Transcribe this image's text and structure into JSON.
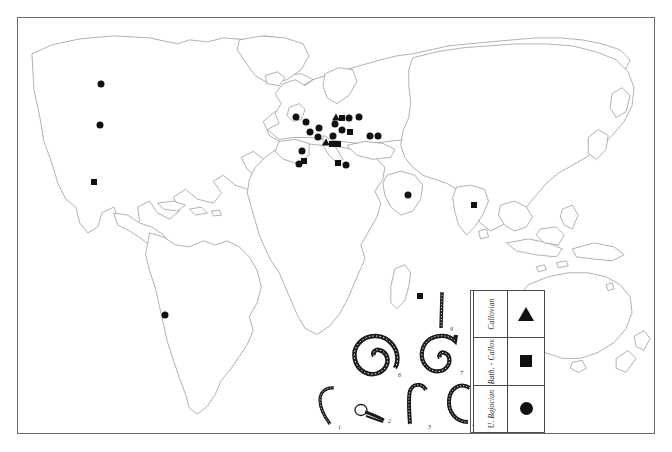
{
  "figure": {
    "type": "distribution-map",
    "frame_border_color": "#6b6b6b",
    "coastline_color": "#8e8e8e",
    "marker_color": "#111111",
    "background": "#ffffff"
  },
  "legend": {
    "title": "",
    "rows": [
      {
        "label": "Callovian",
        "symbol": "triangle",
        "symbol_name": "triangle-marker"
      },
      {
        "label": "Bath. - Callov.",
        "symbol": "square",
        "symbol_name": "square-marker"
      },
      {
        "label": "U. Bajocian",
        "symbol": "circle",
        "symbol_name": "circle-marker"
      }
    ]
  },
  "fossil_plate": {
    "caption": "",
    "specimens": [
      {
        "num": "1",
        "shape": "hook"
      },
      {
        "num": "2",
        "shape": "small-hook"
      },
      {
        "num": "3",
        "shape": "hook"
      },
      {
        "num": "4",
        "shape": "open-hook"
      },
      {
        "num": "5",
        "shape": "coiled-spiral"
      },
      {
        "num": "6",
        "shape": "coiled-spiral"
      },
      {
        "num": "7",
        "shape": "coiled-spiral"
      },
      {
        "num": "8",
        "shape": "straight-rod"
      },
      {
        "num": "9",
        "shape": "straight-rod"
      },
      {
        "num": "10",
        "shape": "curved-rod"
      }
    ]
  },
  "markers": [
    {
      "id": "na-1",
      "type": "circle",
      "x": 83,
      "y": 66,
      "region": "North America - Northwest Canada"
    },
    {
      "id": "na-2",
      "type": "circle",
      "x": 82,
      "y": 107,
      "region": "North America - Western USA"
    },
    {
      "id": "na-3",
      "type": "square",
      "x": 76,
      "y": 164,
      "region": "North America - Mexico"
    },
    {
      "id": "sa-1",
      "type": "circle",
      "x": 147,
      "y": 297,
      "region": "South America - Andes"
    },
    {
      "id": "eu-1",
      "type": "circle",
      "x": 278,
      "y": 99,
      "region": "Europe - British Isles"
    },
    {
      "id": "eu-2",
      "type": "circle",
      "x": 288,
      "y": 104,
      "region": "Europe - Northern France"
    },
    {
      "id": "eu-3",
      "type": "circle",
      "x": 292,
      "y": 114,
      "region": "Europe - France"
    },
    {
      "id": "eu-4",
      "type": "circle",
      "x": 301,
      "y": 110,
      "region": "Europe - Central France"
    },
    {
      "id": "eu-5",
      "type": "circle",
      "x": 300,
      "y": 119,
      "region": "Europe - Eastern France"
    },
    {
      "id": "eu-6",
      "type": "triangle",
      "x": 308,
      "y": 124,
      "region": "Europe - Alps"
    },
    {
      "id": "eu-7",
      "type": "circle",
      "x": 315,
      "y": 118,
      "region": "Europe - Switzerland"
    },
    {
      "id": "eu-8",
      "type": "square",
      "x": 314,
      "y": 126,
      "region": "Europe - Northern Italy"
    },
    {
      "id": "eu-9",
      "type": "square",
      "x": 320,
      "y": 126,
      "region": "Europe - Italy"
    },
    {
      "id": "eu-10",
      "type": "circle",
      "x": 317,
      "y": 106,
      "region": "Europe - Germany"
    },
    {
      "id": "eu-11",
      "type": "triangle",
      "x": 318,
      "y": 99,
      "region": "Europe - North Germany"
    },
    {
      "id": "eu-12",
      "type": "square",
      "x": 324,
      "y": 100,
      "region": "Europe - Poland"
    },
    {
      "id": "eu-13",
      "type": "circle",
      "x": 331,
      "y": 100,
      "region": "Europe - Central Europe"
    },
    {
      "id": "eu-14",
      "type": "circle",
      "x": 341,
      "y": 99,
      "region": "Europe - Eastern Europe"
    },
    {
      "id": "eu-15",
      "type": "circle",
      "x": 324,
      "y": 112,
      "region": "Europe - Austria"
    },
    {
      "id": "eu-16",
      "type": "square",
      "x": 332,
      "y": 114,
      "region": "Europe - Carpathians"
    },
    {
      "id": "eu-17",
      "type": "circle",
      "x": 352,
      "y": 118,
      "region": "Europe - Black Sea region"
    },
    {
      "id": "eu-18",
      "type": "circle",
      "x": 360,
      "y": 118,
      "region": "Europe - Caucasus"
    },
    {
      "id": "eu-19",
      "type": "circle",
      "x": 284,
      "y": 133,
      "region": "Europe - Northern Spain"
    },
    {
      "id": "eu-20",
      "type": "square",
      "x": 286,
      "y": 143,
      "region": "Europe - Iberia"
    },
    {
      "id": "eu-21",
      "type": "circle",
      "x": 281,
      "y": 146,
      "region": "Europe - Southern Spain"
    },
    {
      "id": "eu-22",
      "type": "square",
      "x": 320,
      "y": 145,
      "region": "Africa - Tunisia"
    },
    {
      "id": "eu-23",
      "type": "circle",
      "x": 328,
      "y": 147,
      "region": "Africa - Northern Africa"
    },
    {
      "id": "me-1",
      "type": "circle",
      "x": 390,
      "y": 177,
      "region": "Middle East - Arabia"
    },
    {
      "id": "as-1",
      "type": "square",
      "x": 456,
      "y": 187,
      "region": "Asia - India"
    },
    {
      "id": "af-1",
      "type": "square",
      "x": 402,
      "y": 278,
      "region": "Africa - Madagascar"
    }
  ]
}
